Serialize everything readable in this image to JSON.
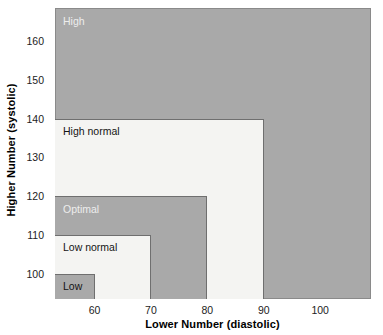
{
  "chart_data": {
    "type": "area",
    "title": "",
    "subtitle": "",
    "xlabel": "Lower Number (diastolic)",
    "ylabel": "Higher Number (systolic)",
    "xlim": [
      53,
      109
    ],
    "ylim": [
      93.5,
      168.5
    ],
    "xticks": [
      60,
      70,
      80,
      90,
      100
    ],
    "yticks": [
      100,
      110,
      120,
      130,
      140,
      160,
      150
    ],
    "xtick_labels": [
      "60",
      "70",
      "80",
      "90",
      "100"
    ],
    "ytick_labels": [
      "160",
      "150",
      "140",
      "130",
      "120",
      "110",
      "100"
    ],
    "grid": false,
    "legend": "none",
    "colors": {
      "shaded_region": "#a9a9a9",
      "light_region": "#f4f4f2",
      "region_border": "#6f6f6f",
      "light_label_text": "#ededed",
      "dark_label_text": "#141414",
      "axis_text": "#1c1c1c"
    },
    "regions": [
      {
        "name": "low",
        "label": "Low",
        "diastolic_max": 60,
        "systolic_max": 100,
        "fill": "shaded",
        "label_color": "dark"
      },
      {
        "name": "low-normal",
        "label": "Low normal",
        "diastolic_max": 70,
        "systolic_max": 110,
        "fill": "light",
        "label_color": "dark"
      },
      {
        "name": "optimal",
        "label": "Optimal",
        "diastolic_max": 80,
        "systolic_max": 120,
        "fill": "shaded",
        "label_color": "light"
      },
      {
        "name": "high-normal",
        "label": "High normal",
        "diastolic_max": 90,
        "systolic_max": 140,
        "fill": "light",
        "label_color": "dark"
      },
      {
        "name": "high",
        "label": "High",
        "diastolic_max": 109,
        "systolic_max": 168.5,
        "fill": "shaded",
        "label_color": "light"
      }
    ]
  }
}
